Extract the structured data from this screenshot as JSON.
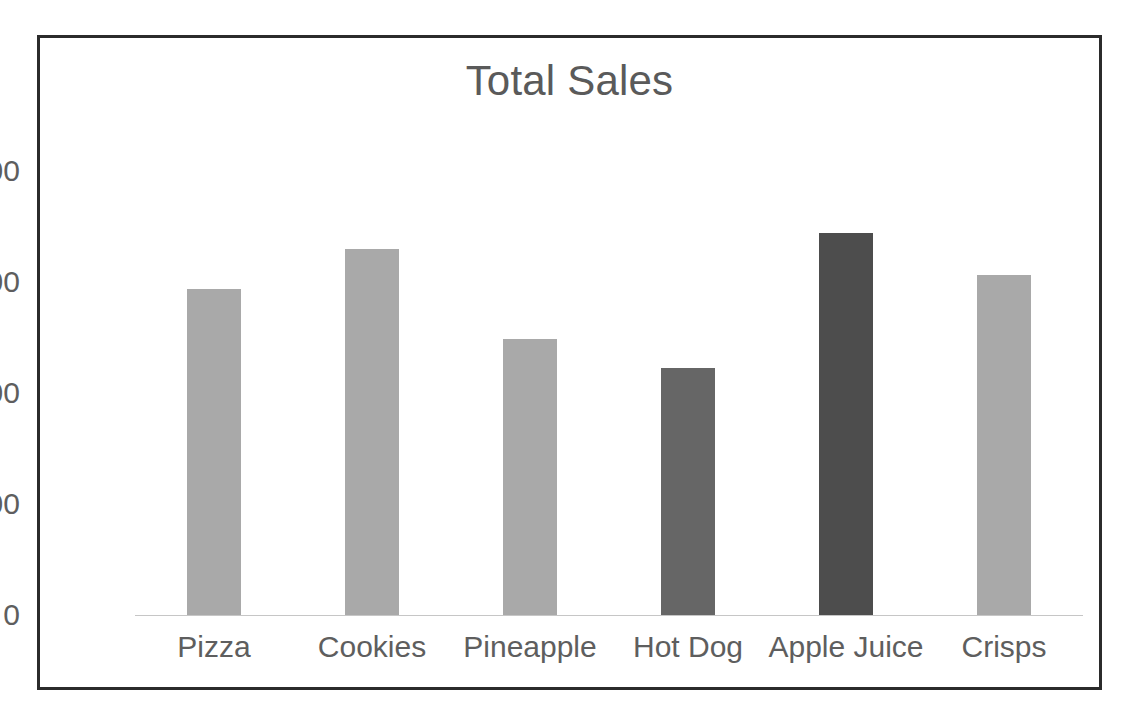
{
  "chart_data": {
    "type": "bar",
    "title": "Total Sales",
    "xlabel": "",
    "ylabel": "",
    "categories": [
      "Pizza",
      "Cookies",
      "Pineapple",
      "Hot Dog",
      "Apple Juice",
      "Crisps"
    ],
    "values": [
      588,
      660,
      497,
      445,
      688,
      612
    ],
    "bar_colors": [
      "#a9a9a9",
      "#a9a9a9",
      "#a9a9a9",
      "#666666",
      "#4d4d4d",
      "#a9a9a9"
    ],
    "ylim": [
      0,
      800
    ],
    "ytick_labels": [
      "0",
      "200",
      "400",
      "600",
      "800"
    ],
    "ytick_values": [
      0,
      200,
      400,
      600,
      800
    ],
    "grid": false,
    "legend": false,
    "legend_position": "none",
    "axis_line_color": "#c6c6c6",
    "text_color": "#5e5e5e",
    "title_color": "#5a5a5a",
    "border_color": "#2b2b2b",
    "background_color": "#ffffff"
  }
}
